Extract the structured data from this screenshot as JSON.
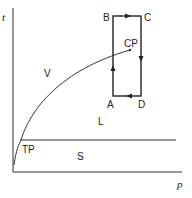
{
  "diagram": {
    "type": "phase-diagram",
    "axes": {
      "x_label": "p",
      "y_label": "t"
    },
    "regions": [
      {
        "id": "vapor",
        "label": "V"
      },
      {
        "id": "liquid",
        "label": "L"
      },
      {
        "id": "solid",
        "label": "S"
      }
    ],
    "points": {
      "triple_point": "TP",
      "critical_point": "CP"
    },
    "cycle": {
      "corners": [
        "A",
        "B",
        "C",
        "D"
      ],
      "direction": "A→B→C→D→A"
    }
  }
}
